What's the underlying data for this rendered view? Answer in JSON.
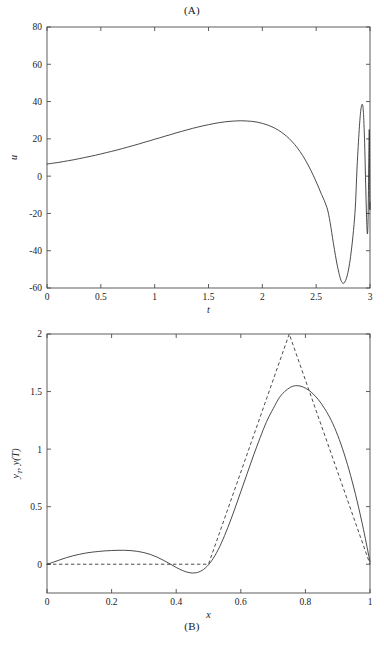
{
  "figure": {
    "panel_a_caption": "(A)",
    "panel_b_caption": "(B)"
  },
  "chart_data": [
    {
      "id": "panel-a",
      "type": "line",
      "title": "(A)",
      "title_position": "top",
      "xlabel": "t",
      "ylabel": "u",
      "xlim": [
        0,
        3
      ],
      "ylim": [
        -60,
        80
      ],
      "xticks": [
        0,
        0.5,
        1,
        1.5,
        2,
        2.5,
        3
      ],
      "xticklabels": [
        "0",
        "0.5",
        "1",
        "1.5",
        "2",
        "2.5",
        "3"
      ],
      "yticks": [
        -60,
        -40,
        -20,
        0,
        20,
        40,
        60,
        80
      ],
      "yticklabels": [
        "-60",
        "-40",
        "-20",
        "0",
        "20",
        "40",
        "60",
        "80"
      ],
      "grid": false,
      "legend": "none",
      "box": true,
      "series": [
        {
          "name": "u(t) control",
          "style": "solid",
          "color": "#2b2b2b",
          "x": [
            0,
            0.05,
            0.1,
            0.15,
            0.2,
            0.25,
            0.3,
            0.35,
            0.4,
            0.45,
            0.5,
            0.55,
            0.6,
            0.65,
            0.7,
            0.75,
            0.8,
            0.85,
            0.9,
            0.95,
            1.0,
            1.05,
            1.1,
            1.15,
            1.2,
            1.25,
            1.3,
            1.35,
            1.4,
            1.45,
            1.5,
            1.55,
            1.6,
            1.65,
            1.7,
            1.75,
            1.8,
            1.85,
            1.9,
            1.95,
            2.0,
            2.05,
            2.1,
            2.15,
            2.2,
            2.25,
            2.3,
            2.35,
            2.4,
            2.45,
            2.5,
            2.55,
            2.6,
            2.63,
            2.66,
            2.7,
            2.74,
            2.78,
            2.82,
            2.86,
            2.88,
            2.9,
            2.915,
            2.93,
            2.94,
            2.95,
            2.958,
            2.965,
            2.971,
            2.976,
            2.981,
            2.985,
            2.988,
            2.991,
            2.993,
            2.995,
            2.9965,
            2.998,
            2.999,
            3.0
          ],
          "y": [
            6.5,
            6.9,
            7.3,
            7.8,
            8.3,
            8.8,
            9.4,
            10.0,
            10.6,
            11.2,
            11.9,
            12.6,
            13.3,
            14.0,
            14.8,
            15.6,
            16.4,
            17.2,
            18.1,
            18.9,
            19.8,
            20.6,
            21.5,
            22.3,
            23.2,
            24.0,
            24.8,
            25.6,
            26.3,
            27.0,
            27.6,
            28.2,
            28.7,
            29.1,
            29.4,
            29.6,
            29.7,
            29.6,
            29.4,
            29.0,
            28.3,
            27.4,
            26.2,
            24.6,
            22.6,
            20.1,
            17.0,
            13.2,
            8.6,
            3.2,
            -3.0,
            -9.8,
            -16.8,
            -25.0,
            -36.0,
            -49.0,
            -57.0,
            -55.0,
            -43.0,
            -20.0,
            5.0,
            25.0,
            35.5,
            38.5,
            33.0,
            18.0,
            0.0,
            -16.0,
            -27.0,
            -31.0,
            -26.0,
            -12.0,
            6.0,
            20.0,
            25.0,
            21.0,
            8.0,
            -8.0,
            -18.0,
            -14.0,
            0.0
          ]
        }
      ],
      "annotations": {
        "initial_value": 6.5,
        "max_before_oscillation": 29.7,
        "max_time": 1.8,
        "min_value": -57,
        "min_time": 2.63,
        "oscillation_onset": 2.6,
        "late_peak": 38.5,
        "late_peak_time": 2.86
      }
    },
    {
      "id": "panel-b",
      "type": "line",
      "title": "(B)",
      "title_position": "bottom",
      "xlabel": "x",
      "ylabel": "y_T , y(T)",
      "ylabel_parts": [
        "y",
        "T",
        ", ",
        "y",
        "(",
        "T",
        ")"
      ],
      "xlim": [
        0,
        1
      ],
      "ylim": [
        -0.25,
        2
      ],
      "xticks": [
        0,
        0.2,
        0.4,
        0.6,
        0.8,
        1
      ],
      "xticklabels": [
        "0",
        "0.2",
        "0.4",
        "0.6",
        "0.8",
        "1"
      ],
      "yticks": [
        0,
        0.5,
        1,
        1.5,
        2
      ],
      "yticklabels": [
        "0",
        "0.5",
        "1",
        "1.5",
        "2"
      ],
      "grid": false,
      "legend": "none",
      "box": true,
      "series": [
        {
          "name": "y(T) achieved state",
          "style": "solid",
          "color": "#2b2b2b",
          "x": [
            0,
            0.02,
            0.04,
            0.06,
            0.08,
            0.1,
            0.12,
            0.14,
            0.16,
            0.18,
            0.2,
            0.22,
            0.24,
            0.26,
            0.28,
            0.3,
            0.32,
            0.34,
            0.36,
            0.38,
            0.4,
            0.42,
            0.44,
            0.46,
            0.48,
            0.5,
            0.52,
            0.54,
            0.56,
            0.58,
            0.6,
            0.62,
            0.64,
            0.66,
            0.68,
            0.7,
            0.72,
            0.74,
            0.76,
            0.78,
            0.8,
            0.82,
            0.84,
            0.86,
            0.88,
            0.9,
            0.92,
            0.94,
            0.96,
            0.98,
            1.0
          ],
          "y": [
            0.0,
            0.018,
            0.038,
            0.057,
            0.073,
            0.086,
            0.097,
            0.105,
            0.111,
            0.116,
            0.119,
            0.121,
            0.121,
            0.118,
            0.112,
            0.101,
            0.085,
            0.063,
            0.035,
            0.004,
            -0.028,
            -0.055,
            -0.073,
            -0.075,
            -0.054,
            -0.005,
            0.075,
            0.185,
            0.32,
            0.47,
            0.63,
            0.79,
            0.95,
            1.1,
            1.24,
            1.35,
            1.45,
            1.51,
            1.545,
            1.55,
            1.53,
            1.49,
            1.43,
            1.35,
            1.25,
            1.12,
            0.96,
            0.77,
            0.55,
            0.3,
            0.02
          ]
        },
        {
          "name": "y_T target state",
          "style": "dashed",
          "color": "#2b2b2b",
          "x": [
            0,
            0.5,
            0.75,
            1.0
          ],
          "y": [
            0.0,
            0.0,
            2.0,
            0.0
          ]
        }
      ],
      "annotations": {
        "target_peak": 2.0,
        "target_peak_x": 0.75,
        "achieved_peak": 1.55,
        "achieved_peak_x": 0.77,
        "achieved_min": -0.075,
        "achieved_min_x": 0.4,
        "achieved_bump": 0.121,
        "achieved_bump_x": 0.23
      }
    }
  ]
}
